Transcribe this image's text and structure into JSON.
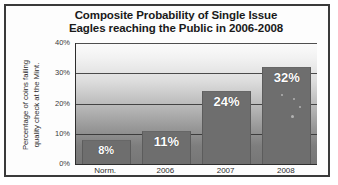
{
  "chart_data": {
    "type": "bar",
    "title": "Composite Probability of Single Issue Eagles reaching the Public in 2006-2008",
    "title_lines": [
      "Composite Probability of Single Issue",
      "Eagles reaching the Public in 2006-2008"
    ],
    "categories": [
      "Norm.",
      "2006",
      "2007",
      "2008"
    ],
    "values": [
      8,
      11,
      24,
      32
    ],
    "data_labels": [
      "8%",
      "11%",
      "24%",
      "32%"
    ],
    "xlabel": "",
    "ylabel": "Percentage of coins failing quality check at the Mint.",
    "ylabel_lines": [
      "Percentage of coins failing",
      "quality check at the Mint."
    ],
    "ylim": [
      0,
      40
    ],
    "ytick_labels": [
      "0%",
      "10%",
      "20%",
      "30%",
      "40%"
    ],
    "ytick_values": [
      0,
      10,
      20,
      30,
      40
    ],
    "grid": true,
    "gridlines_at": [
      10,
      20,
      30,
      40
    ],
    "legend": null,
    "legend_position": "none",
    "colors": {
      "bar_fill": "#6e6e6e",
      "data_label_text": "#ffffff",
      "plot_bg_top": "#fbfbfb",
      "plot_bg_bottom": "#767676",
      "axis_line": "#2d2d2d",
      "gridline": "#2f2f2f",
      "frame_border": "#3a3a3a",
      "title_text": "#1a1a1a",
      "tick_text": "#3b3b3b"
    }
  }
}
